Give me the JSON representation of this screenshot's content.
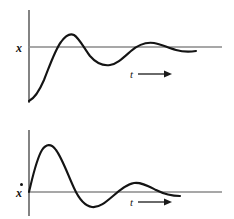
{
  "figure": {
    "title": "",
    "background_color": "#ffffff",
    "curve_color": "#141414",
    "axis_color": "#8a8a8a"
  },
  "panels": [
    {
      "id": "displacement-panel",
      "y_axis_label": "x",
      "y_axis_label_has_overdot": false,
      "x_axis_label": "t",
      "x_axis_arrow": "right-arrow",
      "geometry": {
        "v_axis_x": 29,
        "v_axis_top": 10,
        "v_axis_bottom": 103,
        "h_axis_y": 47,
        "h_axis_left": 28,
        "h_axis_right": 222
      },
      "curve_path": "M 29,101 C 33,99 38,94 44,80 C 50,65 55,50 61,42 C 66,35 70,33 74,35 C 79,38 84,48 90,56 C 96,63 103,66 110,65 C 117,64 123,58 131,51 C 139,44 147,42 154,43 C 161,44 168,48 176,50 C 183,52 190,52 196,51"
    },
    {
      "id": "velocity-panel",
      "y_axis_label": "x",
      "y_axis_label_has_overdot": true,
      "x_axis_label": "t",
      "x_axis_arrow": "right-arrow",
      "geometry": {
        "v_axis_x": 29,
        "v_axis_top": 130,
        "v_axis_bottom": 216,
        "h_axis_y": 192,
        "h_axis_left": 28,
        "h_axis_right": 222
      },
      "curve_path": "M 29,192 C 32,180 36,160 42,150 C 46,144 51,143 56,150 C 62,158 68,175 74,188 C 79,199 85,206 92,207 C 99,208 106,202 113,196 C 120,190 127,184 134,183 C 141,182 148,186 156,190 C 164,194 172,196 180,196"
    }
  ],
  "chart_data": {
    "type": "line",
    "title": "",
    "xlabel": "t",
    "ylabel": "",
    "grid": false,
    "legend": null,
    "subplots": [
      {
        "name": "displacement",
        "ylabel": "x",
        "ylabel_notation": "x",
        "xlabel": "t",
        "axis_zero_level": 0,
        "starts_below_axis": true,
        "initial_value": -1.8,
        "x": [
          0,
          0.2,
          0.45,
          0.7,
          0.95,
          1.2,
          1.5,
          1.85,
          2.2,
          2.6,
          3.0,
          3.4,
          3.8,
          4.2,
          4.6,
          5.0,
          5.5,
          6.0,
          6.5,
          7.0
        ],
        "values": [
          -1.8,
          -1.55,
          -0.95,
          -0.2,
          0.45,
          0.78,
          0.82,
          0.58,
          0.2,
          -0.18,
          -0.38,
          -0.4,
          -0.26,
          -0.05,
          0.1,
          0.17,
          0.14,
          0.06,
          0.0,
          -0.04
        ],
        "zero_crossings": [
          0.82,
          2.35,
          4.35,
          6.5
        ],
        "peaks": [
          {
            "x": 1.45,
            "y": 0.83
          },
          {
            "x": 4.85,
            "y": 0.17
          }
        ],
        "troughs": [
          {
            "x": 3.2,
            "y": -0.4
          }
        ]
      },
      {
        "name": "velocity",
        "ylabel": "x",
        "ylabel_notation": "x-dot",
        "xlabel": "t",
        "axis_zero_level": 0,
        "starts_below_axis": false,
        "initial_value": 0,
        "x": [
          0,
          0.2,
          0.45,
          0.7,
          0.95,
          1.2,
          1.5,
          1.85,
          2.2,
          2.6,
          3.0,
          3.4,
          3.8,
          4.2,
          4.6,
          5.0,
          5.5,
          6.0
        ],
        "values": [
          0,
          0.55,
          0.92,
          1.0,
          0.88,
          0.55,
          0.1,
          -0.35,
          -0.6,
          -0.6,
          -0.4,
          -0.12,
          0.12,
          0.24,
          0.22,
          0.12,
          0.0,
          -0.03
        ],
        "zero_crossings": [
          0,
          1.62,
          3.72,
          5.55
        ],
        "peaks": [
          {
            "x": 0.72,
            "y": 1.0
          },
          {
            "x": 4.25,
            "y": 0.24
          }
        ],
        "troughs": [
          {
            "x": 2.4,
            "y": -0.62
          }
        ]
      }
    ]
  }
}
